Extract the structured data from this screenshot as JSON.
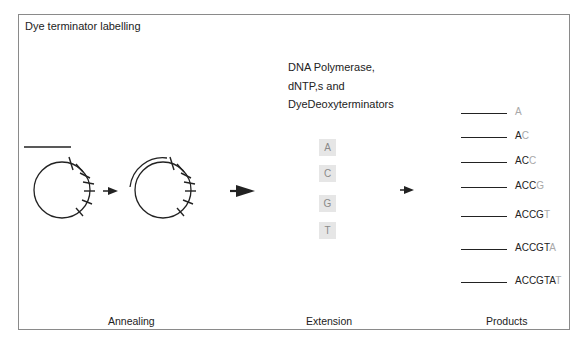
{
  "title": "Dye terminator labelling",
  "reagents": {
    "lines": [
      "DNA Polymerase,",
      "dNTP,s and",
      "DyeDeoxyterminators"
    ]
  },
  "nucleotides": [
    {
      "label": "A",
      "top": 139
    },
    {
      "label": "C",
      "top": 165
    },
    {
      "label": "G",
      "top": 195
    },
    {
      "label": "T",
      "top": 222
    }
  ],
  "products": [
    {
      "prefix": "",
      "last": "A",
      "y": 113
    },
    {
      "prefix": "A",
      "last": "C",
      "y": 137
    },
    {
      "prefix": "AC",
      "last": "C",
      "y": 162
    },
    {
      "prefix": "ACC",
      "last": "G",
      "y": 187
    },
    {
      "prefix": "ACCG",
      "last": "T",
      "y": 216
    },
    {
      "prefix": "ACCGT",
      "last": "A",
      "y": 249
    },
    {
      "prefix": "ACCGTA",
      "last": "T",
      "y": 282
    }
  ],
  "steps": {
    "annealing": "Annealing",
    "extension": "Extension",
    "products": "Products"
  },
  "colors": {
    "ink": "#222222",
    "frame": "#8a8a8a",
    "nucleotide_box": "#e6e6e6",
    "terminator_text": "#a8a8a8"
  }
}
